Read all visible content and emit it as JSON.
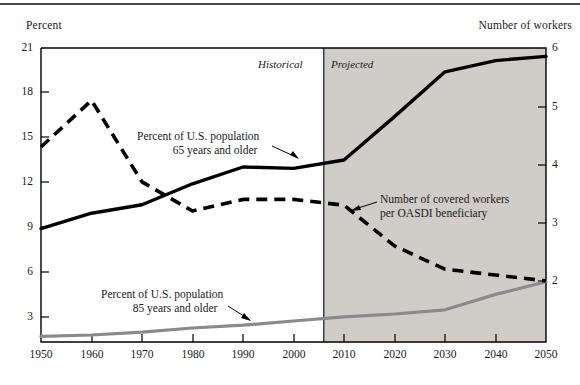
{
  "axes": {
    "left_title": "Percent",
    "right_title": "Number of workers",
    "left_ticks": [
      "21",
      "18",
      "15",
      "12",
      "9",
      "6",
      "3"
    ],
    "right_ticks": [
      "6",
      "5",
      "4",
      "3",
      "2"
    ],
    "x_ticks": [
      "1950",
      "1960",
      "1970",
      "1980",
      "1990",
      "2000",
      "2010",
      "2020",
      "2030",
      "2040",
      "2050"
    ]
  },
  "regions": {
    "historical_label": "Historical",
    "projected_label": "Projected",
    "divider_year": 2006,
    "shade_color": "#d0cdc9"
  },
  "annotations": {
    "pop65": {
      "line1": "Percent of U.S. population",
      "line2": "65 years and older"
    },
    "pop85": {
      "line1": "Percent of U.S. population",
      "line2": "85 years and older"
    },
    "workers": {
      "line1": "Number of covered workers",
      "line2": "per OASDI beneficiary"
    }
  },
  "chart_data": {
    "type": "line",
    "title": "",
    "xlabel": "",
    "ylabel": "Percent",
    "y2label": "Number of workers",
    "xlim": [
      1950,
      2050
    ],
    "ylim": [
      0,
      21
    ],
    "y2lim": [
      0.95,
      6
    ],
    "grid": false,
    "legend": "annotations",
    "x": [
      1950,
      1960,
      1970,
      1980,
      1990,
      2000,
      2010,
      2020,
      2030,
      2040,
      2050
    ],
    "series": [
      {
        "name": "Percent of U.S. population 65 years and older",
        "axis": "left",
        "unit": "percent",
        "style": "solid",
        "color": "#000000",
        "values": [
          8.1,
          9.2,
          9.8,
          11.3,
          12.5,
          12.4,
          13.0,
          16.1,
          19.3,
          20.1,
          20.4
        ]
      },
      {
        "name": "Percent of U.S. population 85 years and older",
        "axis": "left",
        "unit": "percent",
        "style": "solid",
        "color": "#8a8a8a",
        "values": [
          0.4,
          0.5,
          0.7,
          1.0,
          1.2,
          1.5,
          1.8,
          2.0,
          2.3,
          3.4,
          4.3
        ]
      },
      {
        "name": "Number of covered workers per OASDI beneficiary",
        "axis": "right",
        "unit": "workers",
        "style": "dashed",
        "color": "#000000",
        "values": [
          4.3,
          5.1,
          3.7,
          3.2,
          3.4,
          3.4,
          3.3,
          2.6,
          2.2,
          2.1,
          2.0
        ]
      }
    ]
  }
}
